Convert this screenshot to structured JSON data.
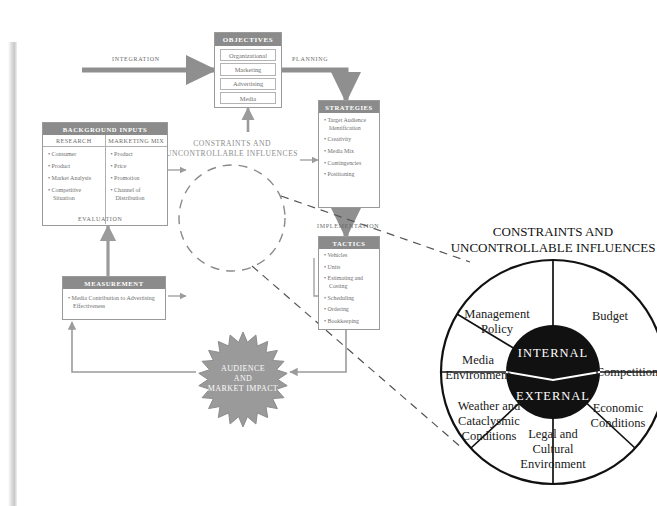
{
  "flow": {
    "objectives": {
      "title": "OBJECTIVES",
      "items": [
        "Organizational",
        "Marketing",
        "Advertising",
        "Media"
      ]
    },
    "background_inputs": {
      "title": "BACKGROUND INPUTS",
      "columns": [
        {
          "header": "RESEARCH",
          "items": [
            "Consumer",
            "Product",
            "Market Analysis",
            "Competitive Situation"
          ]
        },
        {
          "header": "MARKETING MIX",
          "items": [
            "Product",
            "Price",
            "Promotion",
            "Channel of Distribution"
          ]
        }
      ]
    },
    "strategies": {
      "title": "STRATEGIES",
      "items": [
        "Target Audience Identification",
        "Creativity",
        "Media Mix",
        "Contingencies",
        "Positioning"
      ]
    },
    "tactics": {
      "title": "TACTICS",
      "items": [
        "Vehicles",
        "Units",
        "Estimating and Costing",
        "Scheduling",
        "Ordering",
        "Bookkeeping"
      ]
    },
    "measurement": {
      "title": "MEASUREMENT",
      "items": [
        "Media Contribution to Advertising Effectiveness"
      ]
    },
    "connectors": {
      "integration": "INTEGRATION",
      "planning": "PLANNING",
      "implementation": "IMPLEMENTATION",
      "evaluation": "EVALUATION"
    },
    "center_circle": {
      "line1": "CONSTRAINTS AND",
      "line2": "UNCONTROLLABLE INFLUENCES"
    },
    "starburst": {
      "line1": "AUDIENCE",
      "line2": "AND",
      "line3": "MARKET IMPACT"
    }
  },
  "wheel": {
    "heading_line1": "CONSTRAINTS AND",
    "heading_line2": "UNCONTROLLABLE INFLUENCES",
    "core": {
      "top": "INTERNAL",
      "bottom": "EXTERNAL"
    },
    "segments": [
      {
        "name": "management-policy",
        "lines": [
          "Management",
          "Policy"
        ]
      },
      {
        "name": "budget",
        "lines": [
          "Budget"
        ]
      },
      {
        "name": "competition",
        "lines": [
          "Competition"
        ]
      },
      {
        "name": "economic-conditions",
        "lines": [
          "Economic",
          "Conditions"
        ]
      },
      {
        "name": "legal-cultural-environment",
        "lines": [
          "Legal and",
          "Cultural",
          "Environment"
        ]
      },
      {
        "name": "weather-cataclysmic-conditions",
        "lines": [
          "Weather and",
          "Cataclysmic",
          "Conditions"
        ]
      },
      {
        "name": "media-environment",
        "lines": [
          "Media",
          "Environment"
        ]
      }
    ]
  },
  "colors": {
    "header_gray": "#8b8b8b",
    "arrow_gray": "#8f8f8f",
    "star_gray": "#9a9a9a",
    "core_black": "#111111",
    "text_gray": "#6f6f6f"
  }
}
